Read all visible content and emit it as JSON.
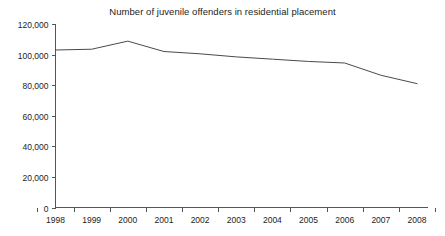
{
  "chart_data": {
    "type": "line",
    "title": "Number of juvenile offenders in residential placement",
    "xlabel": "",
    "ylabel": "",
    "categories": [
      "1998",
      "1999",
      "2000",
      "2001",
      "2002",
      "2003",
      "2004",
      "2005",
      "2006",
      "2007",
      "2008"
    ],
    "values": [
      103000,
      103500,
      108800,
      102000,
      100500,
      98500,
      97000,
      95500,
      94500,
      86500,
      81000
    ],
    "series": [
      {
        "name": "Juvenile offenders in residential placement",
        "values": [
          103000,
          103500,
          108800,
          102000,
          100500,
          98500,
          97000,
          95500,
          94500,
          86500,
          81000
        ]
      }
    ],
    "ylim": [
      0,
      120000
    ],
    "ytick_values": [
      0,
      20000,
      40000,
      60000,
      80000,
      100000,
      120000
    ],
    "ytick_labels": [
      "0",
      "20,000",
      "40,000",
      "60,000",
      "80,000",
      "100,000",
      "120,000"
    ],
    "xtick_labels": [
      "1998",
      "1999",
      "2000",
      "2001",
      "2002",
      "2003",
      "2004",
      "2005",
      "2006",
      "2007",
      "2008"
    ],
    "grid": false,
    "legend": false,
    "legend_position": "none",
    "line_color": "#4a4a4a",
    "axis_color": "#555555",
    "background_color": "#ffffff"
  }
}
